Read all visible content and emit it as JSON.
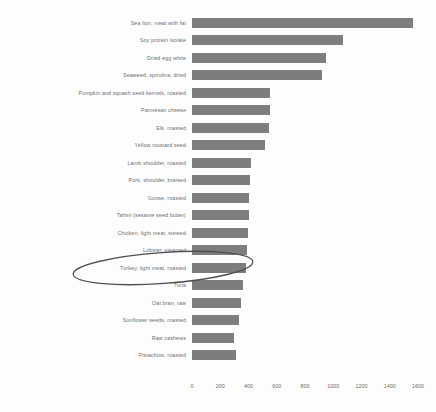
{
  "chart_data": {
    "type": "bar",
    "orientation": "horizontal",
    "title": "",
    "subtitle": "",
    "xlabel": "",
    "ylabel": "",
    "xlim": [
      0,
      1600
    ],
    "grid": false,
    "legend": null,
    "bar_color": "#7d7d7d",
    "background_color": "#fdfdfd",
    "xticks": [
      0,
      200,
      400,
      600,
      800,
      1000,
      1200,
      1400,
      1600
    ],
    "xticklabels": [
      "0",
      "200",
      "400",
      "600",
      "800",
      "1000",
      "1200",
      "1400",
      "1600"
    ],
    "categories": [
      "Sea lion, meat with fat",
      "Soy protein isolate",
      "Dried egg white",
      "Seaweed, spirulina, dried",
      "Pumpkin and squash seed kernels, roasted",
      "Parmesan cheese",
      "Elk, roasted",
      "Yellow mustard seed",
      "Lamb shoulder, roasted",
      "Pork, shoulder, braised",
      "Goose, roasted",
      "Tahini (sesame seed butter)",
      "Chicken, light meat, stewed",
      "Lobster, steamed",
      "Turkey, light meat, roasted",
      "Tuna",
      "Oat bran, raw",
      "Sunflower seeds, roasted",
      "Raw cashews",
      "Pistachios, roasted"
    ],
    "values": [
      1565,
      1070,
      950,
      920,
      555,
      550,
      545,
      520,
      420,
      410,
      405,
      400,
      395,
      390,
      385,
      360,
      350,
      330,
      300,
      315
    ],
    "annotations": [
      {
        "type": "ellipse",
        "shape": "hand-drawn-oval",
        "target_category": "Turkey, light meat, roasted",
        "color": "#4a4a4a"
      }
    ]
  },
  "axis": {
    "origin_label": "0"
  }
}
